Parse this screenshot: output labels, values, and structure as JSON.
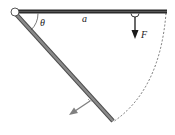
{
  "diagram": {
    "labels": {
      "angle": "θ",
      "length": "a",
      "force": "F"
    },
    "colors": {
      "horizontal_bar": "#2b2b2b",
      "inclined_bar_fill": "#8a8a8a",
      "inclined_bar_edge": "#4a4a4a",
      "force_arrow": "#1a1a1a",
      "reaction_arrow": "#808080",
      "dashed_arc": "#555555",
      "background": "#ffffff"
    }
  }
}
